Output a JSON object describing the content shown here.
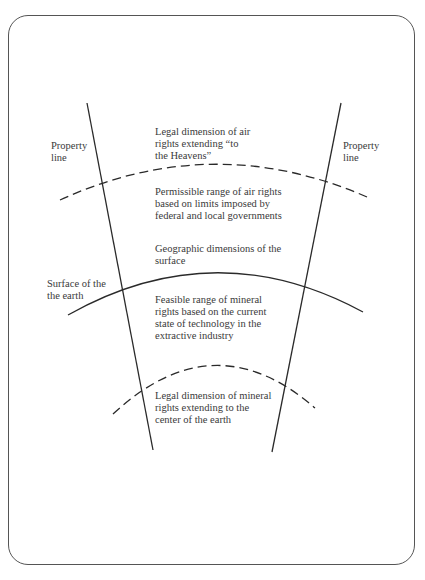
{
  "diagram": {
    "type": "property-rights-dimensions",
    "labels": {
      "property_line_left": "Property\nline",
      "property_line_right": "Property\nline",
      "surface_of_earth": "Surface of the\nthe earth",
      "air_rights_legal": "Legal dimension of air\nrights extending “to\nthe Heavens”",
      "air_rights_permissible": "Permissible range of air rights\nbased on limits imposed by\nfederal and local governments",
      "surface_geographic": "Geographic dimensions of the\nsurface",
      "mineral_rights_feasible": "Feasible range of mineral\nrights based on the current\nstate of technology in the\nextractive industry",
      "mineral_rights_legal": "Legal dimension of mineral\nrights extending to the\ncenter of the earth"
    },
    "lines": [
      {
        "name": "property-line-left",
        "style": "solid"
      },
      {
        "name": "property-line-right",
        "style": "solid"
      },
      {
        "name": "air-rights-limit-arc",
        "style": "dashed"
      },
      {
        "name": "earth-surface-arc",
        "style": "solid"
      },
      {
        "name": "mineral-rights-limit-arc",
        "style": "dashed"
      }
    ],
    "colors": {
      "line": "#2a2a2a",
      "text": "#3a3a3a",
      "frame": "#555555"
    }
  }
}
